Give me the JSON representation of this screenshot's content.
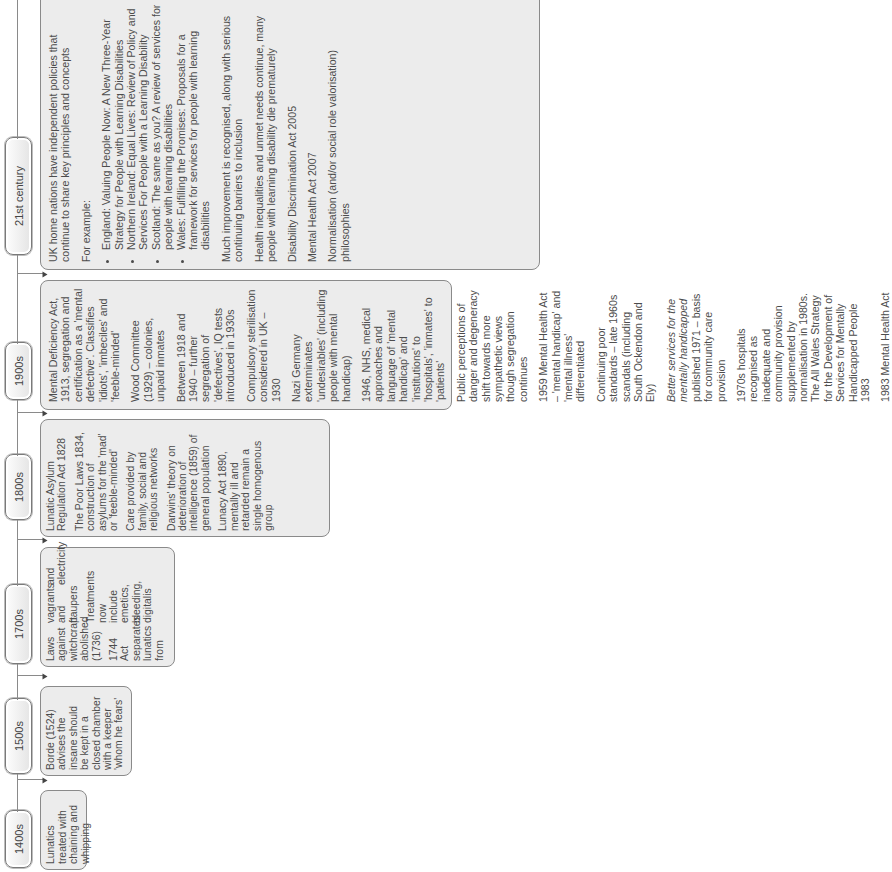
{
  "timeline": {
    "eras": [
      {
        "label": "1400s",
        "items": [
          "Lunatics treated with chaining and whipping"
        ]
      },
      {
        "label": "1500s",
        "items": [
          "Borde (1524) advises the insane should be kept in a closed chamber with a keeper 'whom he fears'"
        ]
      },
      {
        "label": "1700s",
        "items": [
          "Laws against witchcraft abolished (1736)",
          "1744 Act separates lunatics from vagrants and paupers",
          "Treatments now include emetics, bleeding, digitalis and electricity"
        ]
      },
      {
        "label": "1800s",
        "items": [
          "Lunatic Asylum Regulation Act 1828",
          "The Poor Laws 1834, construction of asylums for the 'mad' or 'feeble-minded'",
          "Care provided by family, social and religious networks",
          "Darwins' theory on deterioration of intelligence (1859) of general population",
          "Lunacy Act 1890, mentally ill and retarded remain a single homogenous group"
        ]
      },
      {
        "label": "1900s",
        "items": [
          "Mental Deficiency Act, 1913, segregation and certification as a 'mental defective'. Classifies 'idiots', 'imbeciles' and 'feeble-minded'",
          "Wood Committee (1929) – colonies, unpaid inmates",
          "Between 1918 and 1940 – further segregation of 'defectives', IQ tests introduced in 1930s",
          "Compulsory sterilisation considered in UK – 1930",
          "Nazi Germany exterminates 'undesirables' (including people with mental handicap)",
          "1946, NHS, medical approaches and language of 'mental handicap' and 'institutions' to 'hospitals', 'inmates' to 'patients'",
          "Public perceptions of danger and degeneracy shift towards more sympathetic views though segregation continues",
          "1959 Mental Health Act – 'mental handicap' and 'mental illness' differentiated",
          "Continuing poor standards – late 1960s scandals (including South Ockendon and Ely)",
          "1970s hospitals recognised as inadequate and community provision supplemented by normalisation in 1980s. The All Wales Strategy for the Development of Services for Mentally Handicapped People 1983",
          "1983 Mental Health Act"
        ],
        "better_services": {
          "title_italic": "Better services for the mentally handicapped",
          "rest": "published 1971 – basis for community care provision"
        }
      },
      {
        "label": "21st century",
        "intro": "UK home nations have independent policies that continue to share key principles and concepts",
        "for_example": "For example:",
        "bullets": [
          "England: Valuing People Now: A New Three-Year Strategy for People with Learning Disabilities",
          "Northern Ireland: Equal Lives: Review of Policy and Services For People with a Learning Disability",
          "Scotland: The same as you? A review of services for people with learning disabilities",
          "Wales: Fulfilling the Promises: Proposals for a framework for services for people with learning disabilities"
        ],
        "items": [
          "Much improvement is recognised, along with serious continuing barriers to inclusion",
          "Health inequalities and unmet needs continue, many people with learning disability die prematurely",
          "Disability Discrimination Act 2005",
          "Mental Health Act 2007",
          "Normalisation (and/or social role valorisation) philosophies"
        ]
      }
    ],
    "colors": {
      "box_fill": "#ececec",
      "box_border": "#8a8a8a",
      "text": "#4c4c4c",
      "connector": "#444444"
    }
  }
}
